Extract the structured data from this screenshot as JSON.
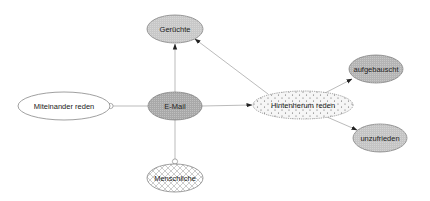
{
  "diagram": {
    "type": "concept-map",
    "nodes": [
      {
        "id": "geruechte",
        "label": "Gerüchte",
        "cx": 175,
        "cy": 29,
        "rx": 28,
        "ry": 14,
        "fill": "#c8c8c8",
        "pattern": "fine"
      },
      {
        "id": "miteinander",
        "label": "Miteinander reden",
        "cx": 64,
        "cy": 106,
        "rx": 46,
        "ry": 14,
        "fill": "#ffffff",
        "pattern": "none"
      },
      {
        "id": "email",
        "label": "E-Mail",
        "cx": 175,
        "cy": 106,
        "rx": 27,
        "ry": 14,
        "fill": "#a9a9a9",
        "pattern": "fine"
      },
      {
        "id": "hintenherum",
        "label": "Hintenherum reden",
        "cx": 303,
        "cy": 105,
        "rx": 50,
        "ry": 14,
        "fill": "#f4f4f4",
        "pattern": "dots"
      },
      {
        "id": "aufgebauscht",
        "label": "aufgebauscht",
        "cx": 376,
        "cy": 69,
        "rx": 27,
        "ry": 14,
        "fill": "#b4b4b4",
        "pattern": "fine"
      },
      {
        "id": "unzufrieden",
        "label": "unzufrieden",
        "cx": 380,
        "cy": 138,
        "rx": 27,
        "ry": 14,
        "fill": "#c4c4c4",
        "pattern": "fine"
      },
      {
        "id": "menschliche",
        "label": "Menschliche",
        "cx": 175,
        "cy": 178,
        "rx": 28,
        "ry": 14,
        "fill": "#ffffff",
        "pattern": "crosshatch"
      }
    ],
    "edges": [
      {
        "from": "email",
        "to": "geruechte",
        "type": "arrow"
      },
      {
        "from": "hintenherum",
        "to": "geruechte",
        "type": "arrow"
      },
      {
        "from": "email",
        "to": "hintenherum",
        "type": "arrow"
      },
      {
        "from": "hintenherum",
        "to": "aufgebauscht",
        "type": "arrow"
      },
      {
        "from": "hintenherum",
        "to": "unzufrieden",
        "type": "arrow"
      },
      {
        "from": "email",
        "to": "miteinander",
        "type": "circle"
      },
      {
        "from": "email",
        "to": "menschliche",
        "type": "circle"
      }
    ]
  }
}
